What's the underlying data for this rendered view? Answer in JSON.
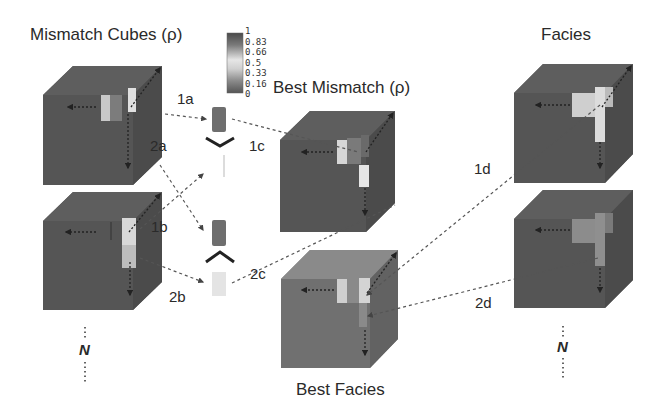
{
  "titles": {
    "mismatch_cubes": "Mismatch Cubes (ρ)",
    "best_mismatch": "Best Mismatch (ρ)",
    "facies": "Facies",
    "best_facies": "Best Facies"
  },
  "colorbar": {
    "ticks": [
      "1",
      "0.83",
      "0.66",
      "0.5",
      "0.33",
      "0.16",
      "0"
    ],
    "colors": [
      "#555555",
      "#777777",
      "#aaaaaa",
      "#dddddd",
      "#aaaaaa",
      "#777777",
      "#555555"
    ]
  },
  "steps": {
    "s1a": "1a",
    "s1b": "1b",
    "s1c": "1c",
    "s1d": "1d",
    "s2a": "2a",
    "s2b": "2b",
    "s2c": "2c",
    "s2d": "2d"
  },
  "ellipsis": {
    "left_n": "N",
    "right_n": "N"
  },
  "operators": {
    "min_top": "∨",
    "max_bottom": "∧"
  },
  "colors": {
    "cube_dark": "#555555",
    "cube_top": "#676767",
    "cube_side": "#4a4a4a",
    "facies_light": "#cfcfcf",
    "facies_mid": "#8c8c8c",
    "best_facies_front": "#707070",
    "best_facies_top": "#8a8a8a"
  }
}
